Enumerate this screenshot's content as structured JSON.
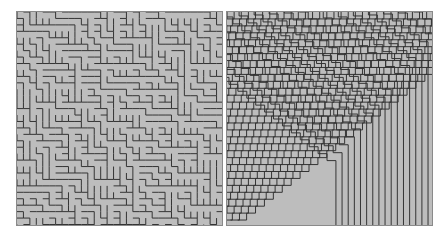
{
  "figure": {
    "background": "#ffffff",
    "panels": [
      {
        "id": "left",
        "label": "Random labyrinth maze pattern",
        "fill": "#bdbdbd",
        "stroke": "#333333",
        "style": "maze"
      },
      {
        "id": "right",
        "label": "Concentric staircase stripe pattern",
        "fill": "#bdbdbd",
        "stroke": "#333333",
        "style": "stripes"
      }
    ]
  }
}
